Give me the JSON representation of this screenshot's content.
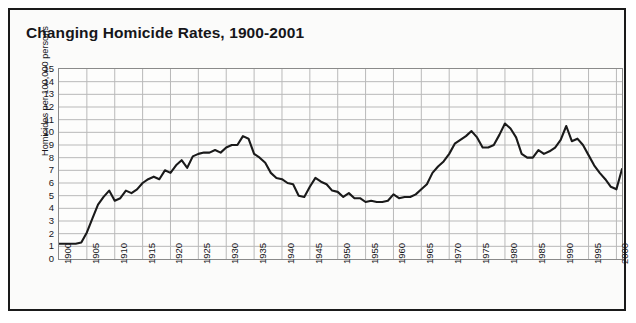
{
  "figure": {
    "title": "Changing Homicide Rates, 1900-2001",
    "border_color": "#1a1a1a",
    "background": "#fbfbfa"
  },
  "chart_data": {
    "type": "line",
    "title": "Changing Homicide Rates, 1900-2001",
    "xlabel": "",
    "ylabel": "Homicides per 100,000 persons",
    "xlim": [
      1900,
      2001
    ],
    "ylim": [
      0,
      15
    ],
    "yticks": [
      0,
      1,
      2,
      3,
      4,
      5,
      6,
      7,
      8,
      9,
      10,
      11,
      12,
      13,
      14,
      15
    ],
    "xticks": [
      1900,
      1905,
      1910,
      1915,
      1920,
      1925,
      1930,
      1935,
      1940,
      1945,
      1950,
      1955,
      1960,
      1965,
      1970,
      1975,
      1980,
      1985,
      1990,
      1995,
      2000
    ],
    "grid": true,
    "legend": null,
    "line_color": "#1a1a1a",
    "line_width": 2.1,
    "x": [
      1900,
      1901,
      1902,
      1903,
      1904,
      1905,
      1906,
      1907,
      1908,
      1909,
      1910,
      1911,
      1912,
      1913,
      1914,
      1915,
      1916,
      1917,
      1918,
      1919,
      1920,
      1921,
      1922,
      1923,
      1924,
      1925,
      1926,
      1927,
      1928,
      1929,
      1930,
      1931,
      1932,
      1933,
      1934,
      1935,
      1936,
      1937,
      1938,
      1939,
      1940,
      1941,
      1942,
      1943,
      1944,
      1945,
      1946,
      1947,
      1948,
      1949,
      1950,
      1951,
      1952,
      1953,
      1954,
      1955,
      1956,
      1957,
      1958,
      1959,
      1960,
      1961,
      1962,
      1963,
      1964,
      1965,
      1966,
      1967,
      1968,
      1969,
      1970,
      1971,
      1972,
      1973,
      1974,
      1975,
      1976,
      1977,
      1978,
      1979,
      1980,
      1981,
      1982,
      1983,
      1984,
      1985,
      1986,
      1987,
      1988,
      1989,
      1990,
      1991,
      1992,
      1993,
      1994,
      1995,
      1996,
      1997,
      1998,
      1999,
      2000,
      2001
    ],
    "values": [
      1.2,
      1.2,
      1.2,
      1.2,
      1.3,
      2.1,
      3.2,
      4.3,
      4.9,
      5.4,
      4.6,
      4.8,
      5.4,
      5.2,
      5.5,
      6.0,
      6.3,
      6.5,
      6.3,
      7.0,
      6.8,
      7.4,
      7.8,
      7.2,
      8.1,
      8.3,
      8.4,
      8.4,
      8.6,
      8.4,
      8.8,
      9.0,
      9.0,
      9.7,
      9.5,
      8.3,
      8.0,
      7.6,
      6.8,
      6.4,
      6.3,
      6.0,
      5.9,
      5.0,
      4.9,
      5.7,
      6.4,
      6.1,
      5.9,
      5.4,
      5.3,
      4.9,
      5.2,
      4.8,
      4.8,
      4.5,
      4.6,
      4.5,
      4.5,
      4.6,
      5.1,
      4.8,
      4.9,
      4.9,
      5.1,
      5.5,
      5.9,
      6.8,
      7.3,
      7.7,
      8.3,
      9.1,
      9.4,
      9.7,
      10.1,
      9.6,
      8.8,
      8.8,
      9.0,
      9.8,
      10.7,
      10.3,
      9.6,
      8.3,
      8.0,
      8.0,
      8.6,
      8.3,
      8.5,
      8.8,
      9.4,
      10.5,
      9.3,
      9.5,
      9.0,
      8.2,
      7.4,
      6.8,
      6.3,
      5.7,
      5.5,
      7.1
    ]
  }
}
